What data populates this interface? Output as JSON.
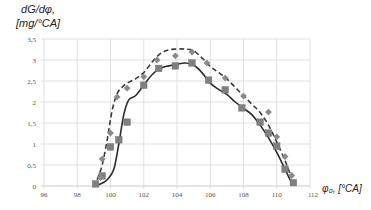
{
  "chart_data": {
    "type": "line",
    "title": "",
    "ylabel_line1": "dG/dφ,",
    "ylabel_line2": "[mg/°CA]",
    "xlabel": "φ₀, [°CA]",
    "xlim": [
      96,
      112
    ],
    "ylim": [
      0,
      3.5
    ],
    "x_ticks": [
      "96",
      "98",
      "100",
      "102",
      "104",
      "106",
      "108",
      "110",
      "112"
    ],
    "y_ticks": [
      "0",
      "0,5",
      "1",
      "1,5",
      "2",
      "2,5",
      "3",
      "3,5"
    ],
    "grid": true,
    "legend": "none",
    "series": [
      {
        "name": "measured (squares)",
        "marker": "square",
        "color": "#808080",
        "x": [
          99.1,
          99.5,
          100.0,
          100.5,
          101.0,
          102.0,
          102.9,
          103.9,
          104.9,
          105.9,
          106.9,
          107.9,
          109.0,
          109.5,
          110.0,
          110.5,
          111.0
        ],
        "y": [
          0.05,
          0.24,
          0.93,
          1.1,
          1.52,
          2.4,
          2.8,
          2.86,
          2.93,
          2.52,
          2.29,
          1.86,
          1.52,
          1.26,
          0.95,
          0.4,
          0.08
        ]
      },
      {
        "name": "measured (diamonds)",
        "marker": "diamond",
        "color": "#8a8a8a",
        "x": [
          99.4,
          99.5,
          100.0,
          100.4,
          101.0,
          102.0,
          102.8,
          103.9,
          104.9,
          105.8,
          106.9,
          108.0,
          109.5,
          110.0,
          110.5,
          110.9
        ],
        "y": [
          0.2,
          0.64,
          1.26,
          2.12,
          2.33,
          2.6,
          3.0,
          3.1,
          3.19,
          2.93,
          2.57,
          2.14,
          1.76,
          1.17,
          0.7,
          0.25
        ]
      },
      {
        "name": "model (solid)",
        "line": "solid",
        "color": "#2b2b2b",
        "x": [
          99.0,
          99.4,
          99.8,
          100.2,
          100.5,
          100.8,
          101.1,
          101.5,
          102.0,
          102.5,
          103.0,
          103.5,
          104.0,
          104.5,
          105.0,
          105.5,
          106.0,
          106.5,
          107.0,
          107.5,
          108.0,
          108.5,
          109.0,
          109.5,
          110.0,
          110.5,
          110.8,
          111.0
        ],
        "y": [
          0.02,
          0.05,
          0.15,
          0.4,
          1.0,
          1.7,
          2.05,
          2.15,
          2.4,
          2.65,
          2.8,
          2.86,
          2.9,
          2.93,
          2.88,
          2.7,
          2.45,
          2.3,
          2.18,
          2.0,
          1.85,
          1.7,
          1.45,
          1.15,
          0.8,
          0.4,
          0.15,
          0.03
        ]
      },
      {
        "name": "model (dashed)",
        "line": "dashed",
        "color": "#3a3a3a",
        "x": [
          99.2,
          99.5,
          99.8,
          100.1,
          100.4,
          100.7,
          101.0,
          101.5,
          102.0,
          102.5,
          103.0,
          103.5,
          104.0,
          104.5,
          105.0,
          105.5,
          106.0,
          106.5,
          107.0,
          107.5,
          108.0,
          108.5,
          109.0,
          109.5,
          110.0,
          110.5,
          110.9
        ],
        "y": [
          0.15,
          0.5,
          1.1,
          1.8,
          2.2,
          2.35,
          2.45,
          2.55,
          2.7,
          2.95,
          3.15,
          3.24,
          3.26,
          3.26,
          3.22,
          3.05,
          2.85,
          2.7,
          2.55,
          2.35,
          2.15,
          1.95,
          1.75,
          1.45,
          1.05,
          0.6,
          0.2
        ]
      }
    ]
  }
}
